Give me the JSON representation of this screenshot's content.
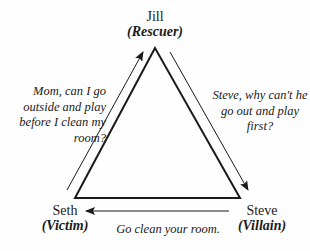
{
  "diagram": {
    "type": "drama-triangle",
    "colors": {
      "line": "#1a1a1a",
      "background": "#fefefe"
    },
    "nodes": {
      "top": {
        "name": "Jill",
        "role": "(Rescuer)"
      },
      "bottom_left": {
        "name": "Seth",
        "role": "(Victim)"
      },
      "bottom_right": {
        "name": "Steve",
        "role": "(Villain)"
      }
    },
    "messages": {
      "left": "Mom, can I go outside and play before I clean my room?",
      "right": "Steve, why can't he go out and play first?",
      "bottom": "Go clean your room."
    },
    "arrows": [
      {
        "from": "Seth",
        "to": "Jill",
        "label_ref": "messages.left"
      },
      {
        "from": "Jill",
        "to": "Steve",
        "label_ref": "messages.right"
      },
      {
        "from": "Steve",
        "to": "Seth",
        "label_ref": "messages.bottom"
      }
    ]
  }
}
